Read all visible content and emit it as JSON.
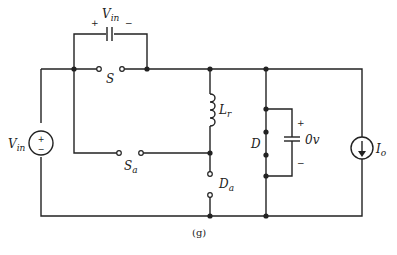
{
  "figure": {
    "caption": "(g)"
  },
  "labels": {
    "vin_cap_main": "V",
    "vin_cap_sub": "in",
    "vin_cap_plus": "+",
    "vin_cap_minus": "−",
    "switch_s": "S",
    "switch_sa_main": "S",
    "switch_sa_sub": "a",
    "inductor_main": "L",
    "inductor_sub": "r",
    "source_main": "V",
    "source_sub": "in",
    "diode_d": "D",
    "diode_da_main": "D",
    "diode_da_sub": "a",
    "cap_voltage": "0v",
    "cap_plus": "+",
    "cap_minus": "−",
    "current_main": "I",
    "current_sub": "o"
  },
  "colors": {
    "wire": "#222222",
    "background": "#ffffff"
  }
}
